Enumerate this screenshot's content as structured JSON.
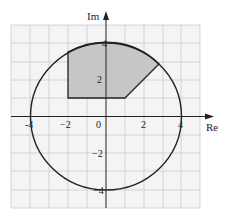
{
  "diagram": {
    "type": "complex-plane",
    "axes": {
      "x_label": "Re",
      "y_label": "Im",
      "x_ticks": [
        {
          "value": -4,
          "label": "-4"
        },
        {
          "value": -2,
          "label": "−2"
        },
        {
          "value": 0,
          "label": "0"
        },
        {
          "value": 2,
          "label": "2"
        },
        {
          "value": 4,
          "label": "4"
        }
      ],
      "y_ticks": [
        {
          "value": 4,
          "label": "4"
        },
        {
          "value": 2,
          "label": "2"
        },
        {
          "value": -2,
          "label": "−2"
        },
        {
          "value": -4,
          "label": "−4"
        }
      ],
      "range": [
        -5,
        5
      ],
      "grid": true
    },
    "circle": {
      "center": [
        0,
        0
      ],
      "radius": 4
    },
    "shaded_region": {
      "description": "Region inside |z|=4 with Re(z) >= -2, Im(z) >= 1, and Im(z) - Re(z) >= 0",
      "vertices": [
        [
          -2,
          1
        ],
        [
          1,
          1
        ],
        [
          2.83,
          2.83
        ],
        [
          -2,
          3.46
        ]
      ],
      "fill": "#c8c8c8"
    },
    "colors": {
      "grid": "#cfcfcf",
      "background": "#f5f5f5",
      "axis": "#222222",
      "circle": "#222222"
    }
  }
}
